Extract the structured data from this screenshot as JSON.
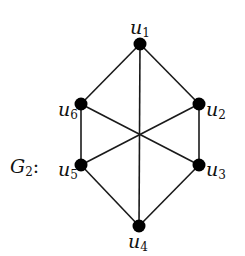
{
  "graph": {
    "name": "G",
    "name_sub": "2",
    "name_suffix": ":",
    "colors": {
      "edge": "#1a1a1a",
      "node": "#000000",
      "background": "#ffffff"
    },
    "nodes": [
      {
        "id": "u1",
        "base": "u",
        "sub": "1",
        "x": 140,
        "y": 44
      },
      {
        "id": "u2",
        "base": "u",
        "sub": "2",
        "x": 199,
        "y": 104
      },
      {
        "id": "u3",
        "base": "u",
        "sub": "3",
        "x": 199,
        "y": 165
      },
      {
        "id": "u4",
        "base": "u",
        "sub": "4",
        "x": 139,
        "y": 226
      },
      {
        "id": "u5",
        "base": "u",
        "sub": "5",
        "x": 81,
        "y": 165
      },
      {
        "id": "u6",
        "base": "u",
        "sub": "6",
        "x": 81,
        "y": 104
      }
    ],
    "edges": [
      [
        "u1",
        "u6"
      ],
      [
        "u1",
        "u2"
      ],
      [
        "u1",
        "u4"
      ],
      [
        "u6",
        "u5"
      ],
      [
        "u2",
        "u3"
      ],
      [
        "u6",
        "u3"
      ],
      [
        "u2",
        "u5"
      ],
      [
        "u5",
        "u4"
      ],
      [
        "u3",
        "u4"
      ]
    ]
  }
}
